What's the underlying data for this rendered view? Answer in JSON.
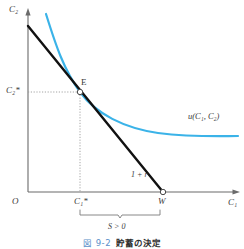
{
  "figure": {
    "axes": {
      "y_axis_label": "C₂",
      "x_axis_label": "C₁",
      "origin_label": "O"
    },
    "ticks": {
      "y_tick_label": "C₂*",
      "x_tick_label": "C₁*",
      "endowment_label": "W"
    },
    "points": {
      "equilibrium_label": "E"
    },
    "curves": {
      "indifference_label": "u(C₁, C₂)",
      "budget_slope_label": "1 + r"
    },
    "annotations": {
      "saving_label": "S > 0"
    },
    "caption": {
      "number": "図 9-2",
      "text": "貯蓄の決定"
    },
    "colors": {
      "indifference_curve": "#3bb3e8",
      "budget_line": "#111111",
      "axis": "#6b6b6b",
      "guide": "#9a9a9a",
      "caption_number": "#5b8fc9"
    }
  }
}
